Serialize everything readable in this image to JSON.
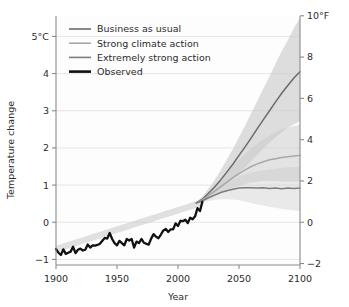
{
  "chart_data": {
    "type": "line",
    "title": "",
    "xlabel": "Year",
    "ylabel": "Temperature change",
    "ylabel_right": "",
    "xlim": [
      1900,
      2100
    ],
    "ylim": [
      -1.15,
      5.55
    ],
    "ylim_right": [
      -2.07,
      9.99
    ],
    "grid": true,
    "grid_axis": "y",
    "legend_position": "top-left",
    "x_ticks": [
      1900,
      1950,
      2000,
      2050,
      2100
    ],
    "x_tick_labels": [
      "1900",
      "1950",
      "2000",
      "2050",
      "2100"
    ],
    "y_ticks": [
      -1,
      0,
      1,
      2,
      3,
      4,
      5
    ],
    "y_tick_labels": [
      "−1",
      "0",
      "1",
      "2",
      "3",
      "4",
      "5°C"
    ],
    "y_ticks_right": [
      -2,
      0,
      2,
      4,
      6,
      8,
      10
    ],
    "y_tick_labels_right": [
      "−2",
      "0",
      "2",
      "4",
      "6",
      "8",
      "10°F"
    ],
    "units_left": "°C",
    "units_right": "°F",
    "colors": {
      "business_as_usual": "#6b6b6b",
      "strong_climate_action": "#a8a8a8",
      "extremely_strong_action": "#7d7d7d",
      "observed": "#111111",
      "band_fill": "#c9c9c9",
      "grid": "#e2e2e2",
      "axis": "#8a8a8a",
      "plot_background": "#fdfdfd"
    },
    "series": [
      {
        "name": "Business as usual",
        "key": "business_as_usual",
        "type": "projection",
        "color": "#6b6b6b",
        "value_2100": 4.05,
        "band_low_2100": 2.72,
        "band_high_2100": 5.5,
        "x": [
          2015,
          2020,
          2025,
          2030,
          2035,
          2040,
          2045,
          2050,
          2055,
          2060,
          2065,
          2070,
          2075,
          2080,
          2085,
          2090,
          2095,
          2100
        ],
        "values": [
          0.52,
          0.62,
          0.78,
          0.95,
          1.14,
          1.35,
          1.56,
          1.8,
          2.03,
          2.27,
          2.52,
          2.76,
          3.0,
          3.24,
          3.47,
          3.68,
          3.88,
          4.05
        ],
        "band_low": [
          0.5,
          0.56,
          0.66,
          0.77,
          0.9,
          1.03,
          1.18,
          1.33,
          1.49,
          1.65,
          1.82,
          1.99,
          2.14,
          2.29,
          2.42,
          2.54,
          2.64,
          2.72
        ],
        "band_high": [
          0.54,
          0.69,
          0.91,
          1.14,
          1.4,
          1.68,
          1.97,
          2.29,
          2.6,
          2.93,
          3.27,
          3.6,
          3.93,
          4.27,
          4.6,
          4.9,
          5.22,
          5.5
        ]
      },
      {
        "name": "Strong climate action",
        "key": "strong_climate_action",
        "type": "projection",
        "color": "#a8a8a8",
        "value_2100": 1.8,
        "band_low_2100": 1.1,
        "band_high_2100": 2.62,
        "x": [
          2015,
          2020,
          2025,
          2030,
          2035,
          2040,
          2045,
          2050,
          2055,
          2060,
          2065,
          2070,
          2075,
          2080,
          2085,
          2090,
          2095,
          2100
        ],
        "values": [
          0.52,
          0.6,
          0.72,
          0.84,
          0.96,
          1.08,
          1.2,
          1.31,
          1.41,
          1.5,
          1.57,
          1.63,
          1.68,
          1.71,
          1.74,
          1.76,
          1.78,
          1.8
        ],
        "band_low": [
          0.5,
          0.55,
          0.62,
          0.7,
          0.78,
          0.85,
          0.92,
          0.98,
          1.03,
          1.07,
          1.09,
          1.11,
          1.11,
          1.11,
          1.1,
          1.1,
          1.1,
          1.1
        ],
        "band_high": [
          0.54,
          0.65,
          0.82,
          0.99,
          1.16,
          1.33,
          1.5,
          1.67,
          1.83,
          1.98,
          2.11,
          2.23,
          2.33,
          2.42,
          2.5,
          2.55,
          2.59,
          2.62
        ]
      },
      {
        "name": "Extremely strong action",
        "key": "extremely_strong_action",
        "type": "projection",
        "color": "#7d7d7d",
        "value_2100": 0.92,
        "band_low_2100": 0.3,
        "band_high_2100": 1.5,
        "x": [
          2015,
          2020,
          2025,
          2030,
          2035,
          2040,
          2045,
          2050,
          2055,
          2060,
          2065,
          2070,
          2075,
          2080,
          2085,
          2090,
          2095,
          2100
        ],
        "values": [
          0.52,
          0.58,
          0.66,
          0.73,
          0.8,
          0.85,
          0.89,
          0.92,
          0.93,
          0.93,
          0.92,
          0.93,
          0.91,
          0.92,
          0.9,
          0.92,
          0.91,
          0.92
        ],
        "band_low": [
          0.5,
          0.53,
          0.57,
          0.6,
          0.62,
          0.62,
          0.61,
          0.59,
          0.56,
          0.52,
          0.48,
          0.45,
          0.42,
          0.39,
          0.36,
          0.34,
          0.32,
          0.3
        ],
        "band_high": [
          0.54,
          0.63,
          0.75,
          0.87,
          0.99,
          1.08,
          1.16,
          1.24,
          1.3,
          1.34,
          1.37,
          1.4,
          1.42,
          1.44,
          1.46,
          1.48,
          1.49,
          1.5
        ]
      },
      {
        "name": "Observed",
        "key": "observed",
        "type": "historical",
        "color": "#111111",
        "x_start": 1900,
        "x_end": 2020,
        "value_1900": -0.72,
        "value_2020": 0.55,
        "x": [
          1900,
          1902,
          1904,
          1906,
          1908,
          1910,
          1912,
          1914,
          1916,
          1918,
          1920,
          1922,
          1924,
          1926,
          1928,
          1930,
          1932,
          1934,
          1936,
          1938,
          1940,
          1942,
          1944,
          1946,
          1948,
          1950,
          1952,
          1954,
          1956,
          1958,
          1960,
          1962,
          1964,
          1966,
          1968,
          1970,
          1972,
          1974,
          1976,
          1978,
          1980,
          1982,
          1984,
          1986,
          1988,
          1990,
          1992,
          1994,
          1996,
          1998,
          2000,
          2002,
          2004,
          2006,
          2008,
          2010,
          2012,
          2014,
          2016,
          2018,
          2020
        ],
        "values": [
          -0.72,
          -0.82,
          -0.88,
          -0.73,
          -0.85,
          -0.82,
          -0.79,
          -0.66,
          -0.83,
          -0.74,
          -0.71,
          -0.76,
          -0.74,
          -0.6,
          -0.68,
          -0.62,
          -0.63,
          -0.61,
          -0.58,
          -0.5,
          -0.42,
          -0.44,
          -0.29,
          -0.45,
          -0.56,
          -0.62,
          -0.5,
          -0.56,
          -0.62,
          -0.45,
          -0.49,
          -0.45,
          -0.68,
          -0.52,
          -0.56,
          -0.45,
          -0.55,
          -0.58,
          -0.6,
          -0.44,
          -0.32,
          -0.39,
          -0.43,
          -0.33,
          -0.22,
          -0.18,
          -0.26,
          -0.19,
          -0.19,
          -0.03,
          -0.1,
          0.04,
          0.03,
          0.07,
          -0.02,
          0.12,
          0.08,
          0.16,
          0.38,
          0.3,
          0.55
        ]
      }
    ],
    "legend": [
      {
        "label": "Business as usual",
        "color": "#6b6b6b",
        "width": 1.6
      },
      {
        "label": "Strong climate action",
        "color": "#a8a8a8",
        "width": 1.6
      },
      {
        "label": "Extremely strong action",
        "color": "#7d7d7d",
        "width": 1.6
      },
      {
        "label": "Observed",
        "color": "#111111",
        "width": 2.6
      }
    ]
  }
}
